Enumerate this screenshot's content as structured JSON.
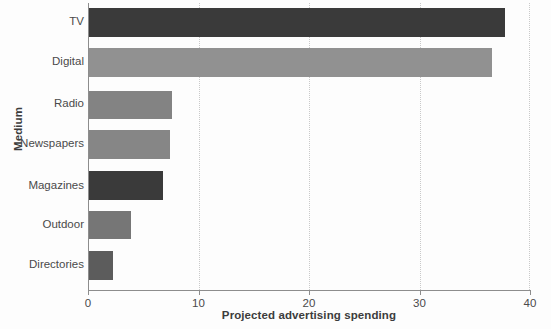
{
  "chart_data": {
    "type": "bar",
    "orientation": "horizontal",
    "title": "",
    "xlabel": "Projected advertising spending",
    "ylabel": "Medium",
    "categories": [
      "TV",
      "Digital",
      "Radio",
      "Newspapers",
      "Magazines",
      "Outdoor",
      "Directories"
    ],
    "values": [
      37.7,
      36.6,
      7.6,
      7.4,
      6.8,
      3.9,
      2.3
    ],
    "bar_colors": [
      "#3a3a3a",
      "#919191",
      "#838383",
      "#868686",
      "#3a3a3a",
      "#767676",
      "#5c5c5c"
    ],
    "xlim": [
      0,
      40
    ],
    "xticks": [
      0,
      10,
      20,
      30,
      40
    ],
    "xtick_labels": [
      "0",
      "10",
      "20",
      "30",
      "40"
    ],
    "grid": {
      "vertical": true,
      "horizontal": false,
      "style": "dotted",
      "color": "#c9c9c9"
    },
    "legend": null,
    "axis_color": "#8d8d8d",
    "background": "#fdfdfd",
    "text_color": "#4a4a4a"
  }
}
